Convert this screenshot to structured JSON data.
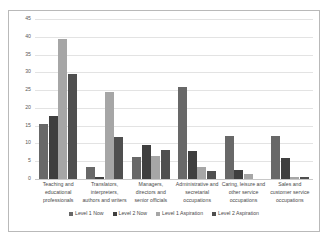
{
  "chart_data": {
    "type": "bar",
    "title": "",
    "xlabel": "",
    "ylabel": "",
    "ylim": [
      0,
      45
    ],
    "yticks": [
      "0",
      "5",
      "10",
      "15",
      "20",
      "25",
      "30",
      "35",
      "40",
      "45"
    ],
    "grid": true,
    "legend_position": "bottom",
    "categories": [
      "Teaching and educational professionals",
      "Translators, interpreters, authors and writers",
      "Managers, directors and senior officials",
      "Administrative and secretarial occupations",
      "Caring, leisure and other service occupations",
      "Sales and customer service occupations"
    ],
    "series": [
      {
        "name": "Level 1 Now",
        "color": "#686868",
        "values": [
          15.5,
          3.5,
          6.1,
          25.9,
          12.2,
          12.2
        ]
      },
      {
        "name": "Level 2 Now",
        "color": "#3f3f3f",
        "values": [
          17.6,
          0.6,
          9.7,
          8.0,
          2.5,
          5.8
        ]
      },
      {
        "name": "Level 1 Aspiration",
        "color": "#a6a6a6",
        "values": [
          39.4,
          24.4,
          6.5,
          3.5,
          1.5,
          0.6
        ]
      },
      {
        "name": "Level 2 Aspiration",
        "color": "#4f4f4f",
        "values": [
          29.5,
          11.9,
          8.1,
          2.3,
          0.0,
          0.5
        ]
      }
    ]
  }
}
